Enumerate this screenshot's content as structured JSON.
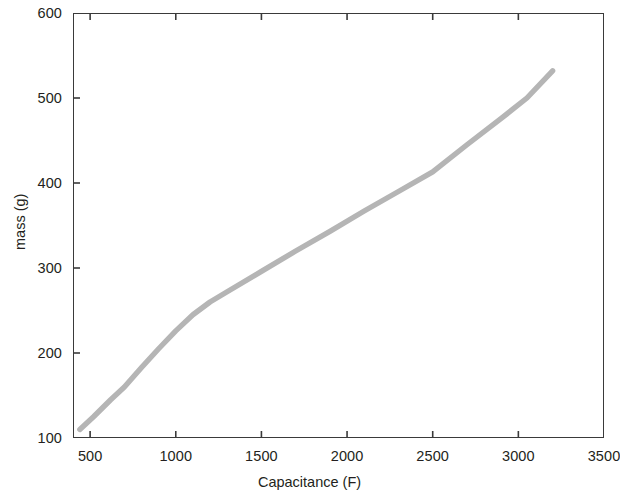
{
  "chart_data": {
    "type": "line",
    "title": "",
    "xlabel": "Capacitance (F)",
    "ylabel": "mass (g)",
    "xlim": [
      400,
      3500
    ],
    "ylim": [
      100,
      600
    ],
    "xticks": [
      500,
      1000,
      1500,
      2000,
      2500,
      3000,
      3500
    ],
    "xtick_labels": [
      "500",
      "1000",
      "1500",
      "2000",
      "2500",
      "3000",
      "3500"
    ],
    "yticks": [
      100,
      200,
      300,
      400,
      500,
      600
    ],
    "ytick_labels": [
      "100",
      "200",
      "300",
      "400",
      "500",
      "600"
    ],
    "grid": false,
    "legend": false,
    "line_color": "#b5b5b5",
    "axis_color": "#3a3a3a",
    "series": [
      {
        "name": "mass vs capacitance",
        "x": [
          440,
          520,
          620,
          700,
          800,
          900,
          1000,
          1100,
          1200,
          1300,
          1500,
          1700,
          1900,
          2100,
          2300,
          2500,
          2700,
          2900,
          3050,
          3200
        ],
        "y": [
          110,
          125,
          145,
          160,
          183,
          205,
          226,
          245,
          260,
          272,
          296,
          320,
          343,
          367,
          390,
          413,
          445,
          476,
          500,
          532
        ]
      }
    ]
  },
  "axis_titles": {
    "x": "Capacitance (F)",
    "y": "mass (g)"
  }
}
